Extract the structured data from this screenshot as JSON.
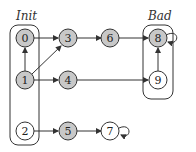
{
  "groups": {
    "init": {
      "label": "Init"
    },
    "bad": {
      "label": "Bad"
    }
  },
  "colors": {
    "filled_node": "#c8c8c8",
    "empty_node": "#ffffff",
    "stroke": "#333333"
  },
  "nodes": [
    {
      "id": "0",
      "label": "0",
      "filled": true
    },
    {
      "id": "1",
      "label": "1",
      "filled": true
    },
    {
      "id": "2",
      "label": "2",
      "filled": false
    },
    {
      "id": "3",
      "label": "3",
      "filled": true
    },
    {
      "id": "4",
      "label": "4",
      "filled": true
    },
    {
      "id": "5",
      "label": "5",
      "filled": true
    },
    {
      "id": "6",
      "label": "6",
      "filled": true
    },
    {
      "id": "7",
      "label": "7",
      "filled": false
    },
    {
      "id": "8",
      "label": "8",
      "filled": true
    },
    {
      "id": "9",
      "label": "9",
      "filled": false
    }
  ],
  "edges": [
    [
      "1",
      "0"
    ],
    [
      "0",
      "3"
    ],
    [
      "1",
      "3"
    ],
    [
      "1",
      "4"
    ],
    [
      "3",
      "6"
    ],
    [
      "6",
      "8"
    ],
    [
      "4",
      "9"
    ],
    [
      "9",
      "8"
    ],
    [
      "8",
      "8"
    ],
    [
      "2",
      "5"
    ],
    [
      "5",
      "7"
    ],
    [
      "7",
      "7"
    ]
  ]
}
